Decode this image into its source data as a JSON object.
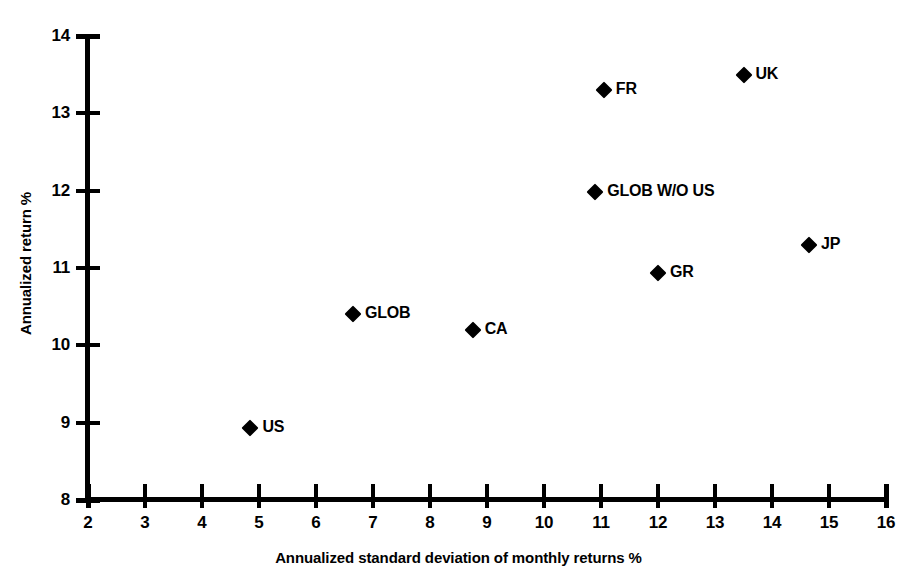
{
  "chart_data": {
    "type": "scatter",
    "title": "",
    "xlabel": "Annualized standard deviation of monthly returns %",
    "ylabel": "Annualized return %",
    "xlim": [
      2,
      16
    ],
    "ylim": [
      8,
      14
    ],
    "xticks": [
      2,
      3,
      4,
      5,
      6,
      7,
      8,
      9,
      10,
      11,
      12,
      13,
      14,
      15,
      16
    ],
    "yticks": [
      8,
      9,
      10,
      11,
      12,
      13,
      14
    ],
    "xticklabels": [
      "2",
      "3",
      "4",
      "5",
      "6",
      "7",
      "8",
      "9",
      "10",
      "11",
      "12",
      "13",
      "14",
      "15",
      "16"
    ],
    "yticklabels": [
      "8",
      "9",
      "10",
      "11",
      "12",
      "13",
      "14"
    ],
    "grid": false,
    "legend": false,
    "marker": "diamond",
    "marker_color": "#000000",
    "points": [
      {
        "label": "US",
        "x": 4.85,
        "y": 8.93
      },
      {
        "label": "GLOB",
        "x": 6.65,
        "y": 10.4
      },
      {
        "label": "CA",
        "x": 8.75,
        "y": 10.2
      },
      {
        "label": "GLOB W/O US",
        "x": 10.9,
        "y": 11.98
      },
      {
        "label": "FR",
        "x": 11.05,
        "y": 13.3
      },
      {
        "label": "GR",
        "x": 12.0,
        "y": 10.93
      },
      {
        "label": "UK",
        "x": 13.5,
        "y": 13.5
      },
      {
        "label": "JP",
        "x": 14.65,
        "y": 11.3
      }
    ]
  },
  "colors": {
    "background": "#ffffff",
    "foreground": "#000000"
  }
}
